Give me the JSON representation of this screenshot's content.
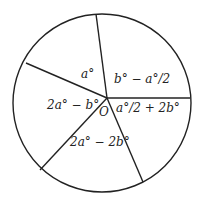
{
  "diagram": {
    "type": "circle-sectors",
    "center_label": "O",
    "sectors": [
      {
        "label": "a°"
      },
      {
        "label": "b° − a°/2"
      },
      {
        "label": "a°/2 + 2b°"
      },
      {
        "label": "2a° − 2b°"
      },
      {
        "label": "2a° − b°"
      }
    ],
    "colors": {
      "stroke": "#222222",
      "background": "#ffffff"
    }
  }
}
